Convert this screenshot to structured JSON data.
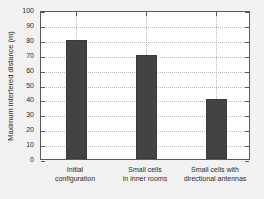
{
  "chart_data": {
    "type": "bar",
    "title": "",
    "subtitle": "",
    "xlabel": "",
    "ylabel": "Maximum interfered distance (m)",
    "categories": [
      "Initial configuration",
      "Small cells in inner rooms",
      "Small cells with directional antennas"
    ],
    "category_lines": [
      [
        "Initial",
        "configuration"
      ],
      [
        "Small cells",
        "in inner rooms"
      ],
      [
        "Small cells with",
        "directional antennas"
      ]
    ],
    "values": [
      80,
      70,
      40
    ],
    "ylim": [
      0,
      100
    ],
    "yticks": [
      0,
      10,
      20,
      30,
      40,
      50,
      60,
      70,
      80,
      90,
      100
    ],
    "ytick_labels": [
      "0",
      "10",
      "20",
      "30",
      "40",
      "50",
      "60",
      "70",
      "80",
      "90",
      "100"
    ],
    "xtick_labels": [
      "",
      "",
      ""
    ],
    "grid": true,
    "grid_style": "dotted",
    "legend": null,
    "legend_position": "none",
    "bar_color": "#434343",
    "axes_color": "#5a5a5a",
    "grid_color": "#b9b9b9",
    "plot_background": "#ffffff",
    "figure_background": "#f2f2f2",
    "bar_width_fraction": 0.3,
    "series_name": "Maximum interfered distance"
  }
}
